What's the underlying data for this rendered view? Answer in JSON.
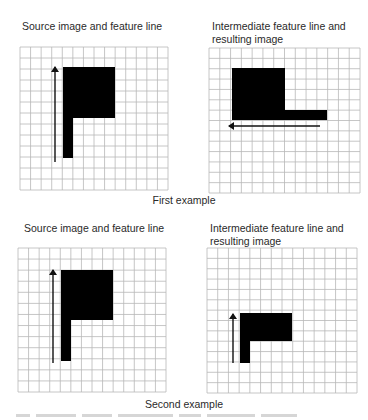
{
  "examples": [
    {
      "caption": "First example",
      "source": {
        "title": "Source image and feature line",
        "grid": {
          "x": 20,
          "y": 47,
          "w": 148,
          "h": 143,
          "cols": 14,
          "rows": 13
        },
        "shape": [
          {
            "x": 63,
            "y": 67,
            "w": 52,
            "h": 51
          },
          {
            "x": 63,
            "y": 118,
            "w": 10,
            "h": 40
          }
        ],
        "arrow": {
          "x1": 55,
          "y1": 162,
          "x2": 55,
          "y2": 67,
          "direction": "up"
        }
      },
      "result": {
        "title": "Intermediate feature line and\nresulting image",
        "grid": {
          "x": 209,
          "y": 48,
          "w": 151,
          "h": 145,
          "cols": 14,
          "rows": 14
        },
        "shape": [
          {
            "x": 232,
            "y": 68,
            "w": 53,
            "h": 52
          },
          {
            "x": 285,
            "y": 110,
            "w": 42,
            "h": 10
          }
        ],
        "arrow": {
          "x1": 320,
          "y1": 126,
          "x2": 229,
          "y2": 126,
          "direction": "left"
        }
      }
    },
    {
      "caption": "Second example",
      "source": {
        "title": "Source image and feature line",
        "grid": {
          "x": 18,
          "y": 248,
          "w": 148,
          "h": 144,
          "cols": 14,
          "rows": 13
        },
        "shape": [
          {
            "x": 61,
            "y": 270,
            "w": 52,
            "h": 50
          },
          {
            "x": 61,
            "y": 320,
            "w": 10,
            "h": 41
          }
        ],
        "arrow": {
          "x1": 53,
          "y1": 363,
          "x2": 53,
          "y2": 270,
          "direction": "up"
        }
      },
      "result": {
        "title": "Intermediate feature line and\nresulting image",
        "grid": {
          "x": 207,
          "y": 248,
          "w": 150,
          "h": 145,
          "cols": 14,
          "rows": 14
        },
        "shape": [
          {
            "x": 240,
            "y": 313,
            "w": 52,
            "h": 28
          },
          {
            "x": 240,
            "y": 341,
            "w": 10,
            "h": 22
          }
        ],
        "arrow": {
          "x1": 233,
          "y1": 363,
          "x2": 233,
          "y2": 314,
          "direction": "up"
        }
      }
    }
  ],
  "colors": {
    "grid": "#b8b8b8",
    "shape": "#000000",
    "arrow": "#111111",
    "text": "#2a2a2a"
  }
}
